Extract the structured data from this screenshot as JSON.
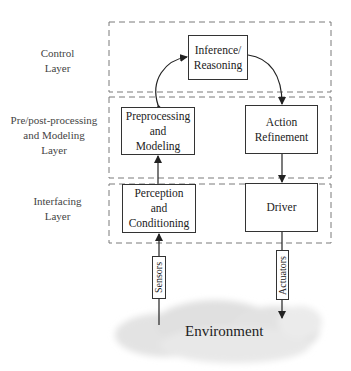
{
  "layers": [
    {
      "label_line1": "Control",
      "label_line2": "Layer",
      "label_line3": ""
    },
    {
      "label_line1": "Pre/post-processing",
      "label_line2": "and Modeling",
      "label_line3": "Layer"
    },
    {
      "label_line1": "Interfacing",
      "label_line2": "Layer",
      "label_line3": ""
    }
  ],
  "boxes": {
    "inference": {
      "line1": "Inference/",
      "line2": "Reasoning",
      "line3": ""
    },
    "preprocessing": {
      "line1": "Preprocessing",
      "line2": "and",
      "line3": "Modeling"
    },
    "action_refinement": {
      "line1": "Action",
      "line2": "Refinement",
      "line3": ""
    },
    "perception": {
      "line1": "Perception",
      "line2": "and",
      "line3": "Conditioning"
    },
    "driver": {
      "line1": "Driver",
      "line2": "",
      "line3": ""
    }
  },
  "io": {
    "sensors": "Sensors",
    "actuators": "Actuators"
  },
  "environment": {
    "label": "Environment"
  },
  "colors": {
    "stroke": "#333333",
    "dash": "#7a7a7a",
    "cloud": "#e6e6e6",
    "text": "#222222"
  }
}
